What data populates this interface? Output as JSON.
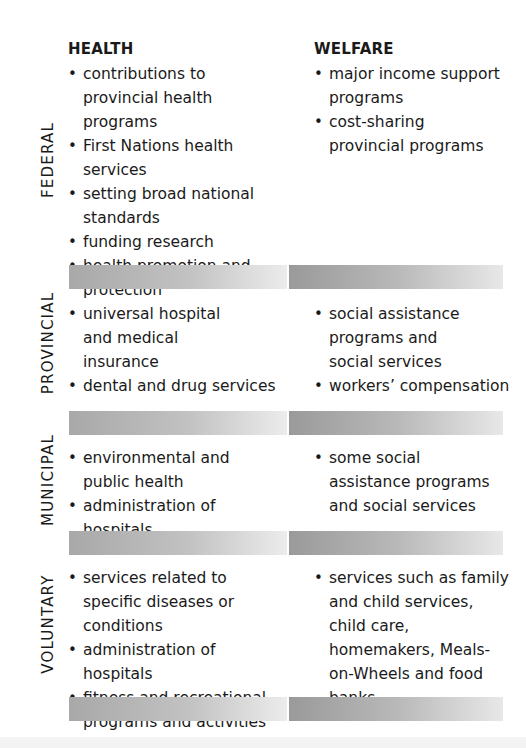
{
  "columns": {
    "health": "HEALTH",
    "welfare": "WELFARE"
  },
  "rows": [
    {
      "label": "FEDERAL",
      "health": [
        "contributions to provincial health programs",
        "First Nations health services",
        "setting broad national standards",
        "funding research",
        "health promotion and protection"
      ],
      "welfare": [
        "major income support programs",
        "cost-sharing provincial programs"
      ]
    },
    {
      "label": "PROVINCIAL",
      "health": [
        "universal hospital and medical insurance",
        "dental and drug services"
      ],
      "welfare": [
        "social assistance programs and social services",
        "workers’ compensation"
      ]
    },
    {
      "label": "MUNICIPAL",
      "health": [
        "environmental and public health",
        "administration of hospitals"
      ],
      "welfare": [
        "some social assistance programs and social services"
      ]
    },
    {
      "label": "VOLUNTARY",
      "health": [
        "services related to specific diseases or conditions",
        "administration of hospitals",
        "fitness and recreational programs and activities"
      ],
      "welfare": [
        "services such as family and child services, child care, homemakers, Meals-on-Wheels and food banks"
      ]
    }
  ],
  "colors": {
    "text": "#1a1a1a",
    "bar_left_start": "#a8a8a8",
    "bar_right_start": "#9a9a9a",
    "bar_end": "#ececec"
  }
}
